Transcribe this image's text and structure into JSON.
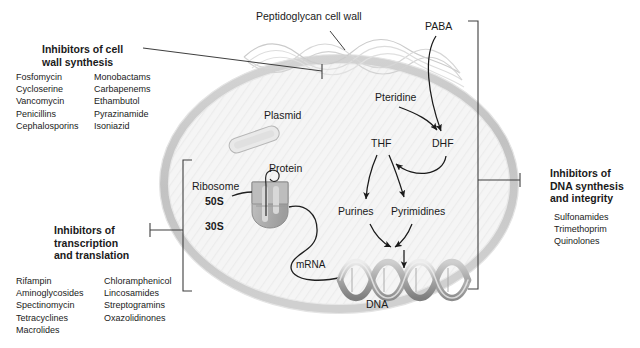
{
  "figure": {
    "title_internal": "Antibiotic mechanisms of action in a bacterial cell",
    "colors": {
      "membrane": "#c9c9c9",
      "cytoplasm": "#f4f4f4",
      "cell_wall_mesh": "#cfcfcf",
      "dna": "#9a9a9a",
      "ribosome": "#b4b4b4",
      "plasmid": "#e2e2e2",
      "text": "#1a1a1a",
      "leader": "#4a4a4a"
    }
  },
  "panels": {
    "cell_wall": {
      "heading_line1": "Inhibitors of cell",
      "heading_line2": "wall synthesis",
      "drugs_col1": [
        "Fosfomycin",
        "Cycloserine",
        "Vancomycin",
        "Penicillins",
        "Cephalosporins"
      ],
      "drugs_col2": [
        "Monobactams",
        "Carbapenems",
        "Ethambutol",
        "Pyrazinamide",
        "Isoniazid"
      ]
    },
    "transcription": {
      "heading_line1": "Inhibitors of",
      "heading_line2": "transcription",
      "heading_line3": "and translation",
      "drugs_col1": [
        "Rifampin",
        "Aminoglycosides",
        "Spectinomycin",
        "Tetracyclines",
        "Macrolides"
      ],
      "drugs_col2": [
        "Chloramphenicol",
        "Lincosamides",
        "Streptogramins",
        "Oxazolidinones"
      ]
    },
    "dna_synthesis": {
      "heading_line1": "Inhibitors of",
      "heading_line2": "DNA synthesis",
      "heading_line3": "and integrity",
      "drugs_col1": [
        "Sulfonamides",
        "Trimethoprim",
        "Quinolones"
      ]
    }
  },
  "diagram_labels": {
    "cell_wall": "Peptidoglycan cell wall",
    "plasmid": "Plasmid",
    "protein": "Protein",
    "ribosome": "Ribosome",
    "subunit_large": "50S",
    "subunit_small": "30S",
    "mrna": "mRNA",
    "dna": "DNA",
    "paba": "PABA",
    "pteridine": "Pteridine",
    "dhf": "DHF",
    "thf": "THF",
    "purines": "Purines",
    "pyrimidines": "Pyrimidines"
  },
  "pathway": {
    "nodes": [
      "PABA",
      "Pteridine",
      "DHF",
      "THF",
      "Purines",
      "Pyrimidines",
      "DNA"
    ],
    "edges": [
      {
        "from": "PABA",
        "to": "DHF"
      },
      {
        "from": "Pteridine",
        "to": "DHF"
      },
      {
        "from": "DHF",
        "to": "THF"
      },
      {
        "from": "THF",
        "to": "Purines"
      },
      {
        "from": "THF",
        "to": "Pyrimidines"
      },
      {
        "from": "Purines",
        "to": "DNA"
      },
      {
        "from": "Pyrimidines",
        "to": "DNA"
      }
    ]
  }
}
